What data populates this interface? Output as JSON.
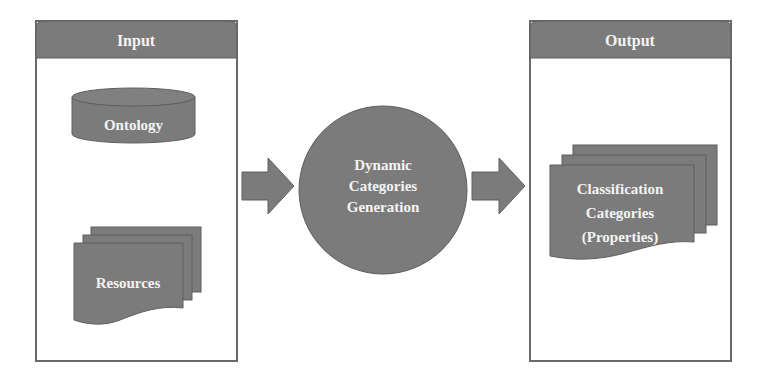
{
  "diagram": {
    "colors": {
      "shape_fill": "#7b7b7b",
      "shape_stroke": "#5e5e5e",
      "panel_border": "#6a6a6a",
      "label_text": "#f4f4f4",
      "background": "#ffffff"
    },
    "input_panel": {
      "title": "Input",
      "ontology": {
        "label": "Ontology",
        "shape": "cylinder"
      },
      "resources": {
        "label": "Resources",
        "shape": "multi-document"
      }
    },
    "process": {
      "shape": "circle",
      "lines": [
        "Dynamic",
        "Categories",
        "Generation"
      ]
    },
    "output_panel": {
      "title": "Output",
      "result": {
        "shape": "multi-document",
        "lines": [
          "Classification",
          "Categories",
          "(Properties)"
        ]
      }
    },
    "connectors": [
      {
        "from": "input_panel",
        "to": "process",
        "type": "block-arrow"
      },
      {
        "from": "process",
        "to": "output_panel",
        "type": "block-arrow"
      }
    ]
  }
}
